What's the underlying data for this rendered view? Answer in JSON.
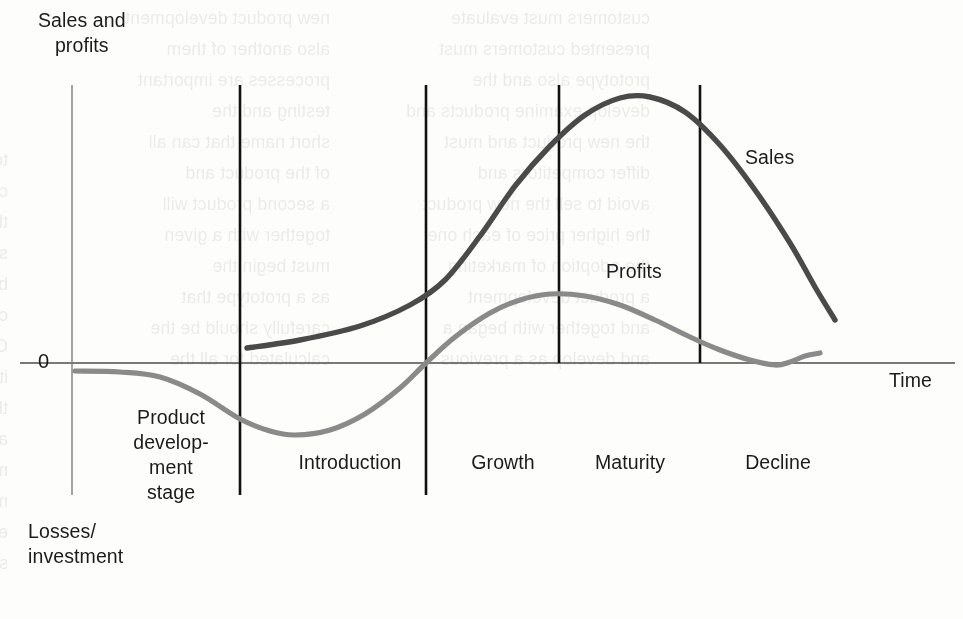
{
  "chart_data": {
    "type": "line",
    "xlabel": "Time",
    "ylabel": "Sales and profits",
    "grid": false,
    "legend_position": "inline-annotations",
    "zero_label": "0",
    "axis_upper_label": "Sales and\nprofits",
    "axis_lower_label": "Losses/\ninvestment",
    "stages": [
      {
        "name": "Product develop-\nment\nstage",
        "display": "Product\ndevelop-\nment\nstage"
      },
      {
        "name": "Introduction",
        "display": "Introduction"
      },
      {
        "name": "Growth",
        "display": "Growth"
      },
      {
        "name": "Maturity",
        "display": "Maturity"
      },
      {
        "name": "Decline",
        "display": "Decline"
      }
    ],
    "stage_boundaries_px": [
      240,
      426,
      559,
      700
    ],
    "series": [
      {
        "name": "Sales",
        "color": "#4a4a4a",
        "description": "Begins at zero at start of Introduction, rises slowly, accelerates through Growth, peaks in Maturity, then declines steadily through Decline.",
        "points": [
          {
            "x": 247,
            "y": 348
          },
          {
            "x": 300,
            "y": 340
          },
          {
            "x": 360,
            "y": 326
          },
          {
            "x": 410,
            "y": 305
          },
          {
            "x": 445,
            "y": 280
          },
          {
            "x": 480,
            "y": 236
          },
          {
            "x": 515,
            "y": 186
          },
          {
            "x": 550,
            "y": 146
          },
          {
            "x": 585,
            "y": 115
          },
          {
            "x": 620,
            "y": 98
          },
          {
            "x": 650,
            "y": 97
          },
          {
            "x": 685,
            "y": 112
          },
          {
            "x": 720,
            "y": 145
          },
          {
            "x": 755,
            "y": 190
          },
          {
            "x": 790,
            "y": 243
          },
          {
            "x": 815,
            "y": 287
          },
          {
            "x": 835,
            "y": 320
          }
        ]
      },
      {
        "name": "Profits",
        "color": "#8a8a8a",
        "description": "Starts slightly below zero during product development, dips to a loss trough in early Introduction, rises to cross zero during Growth, peaks broadly in Maturity, then falls toward zero in Decline with a small upturn at the end.",
        "points": [
          {
            "x": 75,
            "y": 371
          },
          {
            "x": 120,
            "y": 372
          },
          {
            "x": 160,
            "y": 377
          },
          {
            "x": 200,
            "y": 394
          },
          {
            "x": 240,
            "y": 419
          },
          {
            "x": 270,
            "y": 431
          },
          {
            "x": 295,
            "y": 435
          },
          {
            "x": 330,
            "y": 430
          },
          {
            "x": 365,
            "y": 414
          },
          {
            "x": 400,
            "y": 388
          },
          {
            "x": 426,
            "y": 363
          },
          {
            "x": 455,
            "y": 337
          },
          {
            "x": 490,
            "y": 313
          },
          {
            "x": 520,
            "y": 300
          },
          {
            "x": 550,
            "y": 294
          },
          {
            "x": 585,
            "y": 296
          },
          {
            "x": 620,
            "y": 305
          },
          {
            "x": 655,
            "y": 320
          },
          {
            "x": 690,
            "y": 337
          },
          {
            "x": 720,
            "y": 350
          },
          {
            "x": 750,
            "y": 360
          },
          {
            "x": 775,
            "y": 365
          },
          {
            "x": 790,
            "y": 362
          },
          {
            "x": 805,
            "y": 356
          },
          {
            "x": 820,
            "y": 353
          }
        ]
      }
    ],
    "annotations": [
      {
        "text": "Sales",
        "x": 745,
        "y": 145
      },
      {
        "text": "Profits",
        "x": 606,
        "y": 259
      }
    ],
    "axes": {
      "x_axis_y_px": 363,
      "y_axis_x_px": 72,
      "x_axis_start_px": 20,
      "x_axis_end_px": 955,
      "y_axis_top_px": 85,
      "y_axis_bottom_px": 495
    },
    "colors": {
      "sales": "#4a4a4a",
      "profits": "#8a8a8a",
      "divider": "#111111",
      "axis": "#4d4d4d",
      "text": "#1b1b1b",
      "background": "#fdfdfc"
    }
  },
  "labels": {
    "axis_y_top": "Sales and\nprofits",
    "zero": "0",
    "axis_y_bottom": "Losses/\ninvestment",
    "axis_x": "Time",
    "stage_product_development": "Product\ndevelop-\nment\nstage",
    "stage_introduction": "Introduction",
    "stage_growth": "Growth",
    "stage_maturity": "Maturity",
    "stage_decline": "Decline",
    "series_sales": "Sales",
    "series_profits": "Profits"
  },
  "bleed_text": {
    "left": [
      "to the customer and then",
      "company must decide",
      "the same as the actual",
      "stage of the product, the",
      "but not all of them will",
      "consider the market",
      "Co-branding and product",
      "its suppliers and the",
      "the product concept is",
      "and product design",
      "must be tested in the",
      "materials and costs",
      "estimated separately",
      "strength and reliability"
    ],
    "middle": [
      "new product development",
      "also another of them",
      "processes are important",
      "testing and the",
      "short name that can all",
      "of the product and",
      "a second product will",
      "together with a given",
      "must begin the",
      "as a prototype that",
      "carefully should be the",
      "calculated for all the"
    ],
    "right": [
      "customers must evaluate",
      "presented customers must",
      "prototype also and the",
      "develop examine products and",
      "the new product and must",
      "differ competitors and",
      "avoid to sell the new product",
      "the higher price of each one",
      "the adoption of marketing",
      "a product development",
      "and together with began a",
      "and develop as a previous"
    ]
  }
}
